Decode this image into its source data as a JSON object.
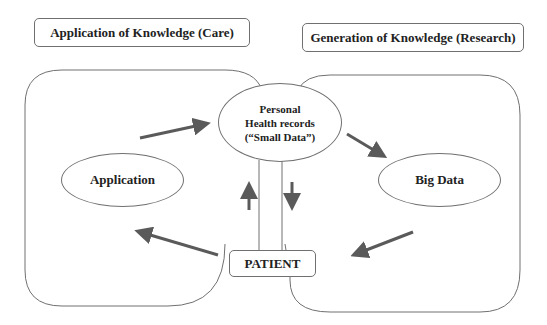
{
  "headers": {
    "care": "Application of Knowledge (Care)",
    "research": "Generation of Knowledge (Research)"
  },
  "nodes": {
    "phr_line1": "Personal",
    "phr_line2": "Health records",
    "phr_line3": "(“Small Data”)",
    "application": "Application",
    "big_data": "Big Data",
    "patient": "PATIENT"
  },
  "colors": {
    "outline": "#707070",
    "arrow": "#5a5a5a",
    "text": "#222222"
  }
}
